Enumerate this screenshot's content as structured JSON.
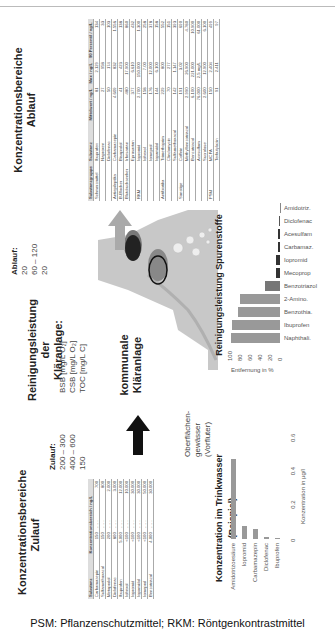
{
  "footer": "PSM: Pflanzenschutzmittel; RKM: Röntgenkontrastmittel",
  "zulauf_section": {
    "title_line1": "Konzentrationsbereiche",
    "title_line2": "Zulauf",
    "headers": [
      "Substanz",
      "Konzentrationsbereich / ng/L"
    ],
    "rows": [
      {
        "substanz": "Carbamazepin",
        "min": "150",
        "max": "700"
      },
      {
        "substanz": "Sulfamethoxazol",
        "min": "150",
        "max": "800"
      },
      {
        "substanz": "Metoprolol",
        "min": "200",
        "max": "2.000"
      },
      {
        "substanz": "Diclofenac",
        "min": "800",
        "max": "3.000"
      },
      {
        "substanz": "Ibuprofen",
        "min": "5.000",
        "max": "12.000"
      },
      {
        "substanz": "Iohexol",
        "min": "<100",
        "max": "10.000"
      },
      {
        "substanz": "Iopromid",
        "min": "<100",
        "max": "30.000"
      },
      {
        "substanz": "Iopamidol",
        "min": "<100",
        "max": "30.000"
      },
      {
        "substanz": "Iomeprol",
        "min": "<100",
        "max": "50.000"
      },
      {
        "substanz": "Benzotriazol",
        "min": "4.000",
        "max": "30.000"
      }
    ]
  },
  "middle": {
    "zulauf_label": "Zulauf:",
    "zulauf_values": [
      "200 – 300",
      "400 – 600",
      "150"
    ],
    "reinigung_title_line1": "Reinigungsleistung der",
    "reinigung_title_line2": "Kläranlage:",
    "params": [
      "BSB [mg/L O₂]",
      "CSB [mg/L O₂]",
      "TOC [mg/L C]"
    ],
    "ablauf_label": "Ablauf:",
    "ablauf_values": [
      "20",
      "60 – 120",
      "20"
    ],
    "plant_label_line1": "kommunale",
    "plant_label_line2": "Kläranlage",
    "water_label_line1": "Oberflächen-",
    "water_label_line2": "gewässer (Vorfluter)"
  },
  "ablauf_section": {
    "title_line1": "Konzentrationsbereiche",
    "title_line2": "Ablauf",
    "headers": [
      "Substanzgruppe",
      "Substanz",
      "Mittelwert / ng/L",
      "Max / ng/L",
      "90 Perzentil / ng/L"
    ],
    "rows": [
      {
        "gruppe": "Schmerzmittel",
        "substanz": "Ibuprofen",
        "mittel": "81",
        "max": "2.129",
        "p90": "134"
      },
      {
        "gruppe": "",
        "substanz": "Naproxen",
        "mittel": "27",
        "max": "958",
        "p90": "33"
      },
      {
        "gruppe": "",
        "substanz": "Diclofenac",
        "mittel": "50",
        "max": "174",
        "p90": "103"
      },
      {
        "gruppe": "Antiepileptika",
        "substanz": "Carbamazepin",
        "mittel": "4.609",
        "max": "832",
        "p90": "1.556"
      },
      {
        "gruppe": "B-Blocker",
        "substanz": "Bisoprolol",
        "mittel": "41",
        "max": "423",
        "p90": "138"
      },
      {
        "gruppe": "Blutdrucksenker",
        "substanz": "Irbesartan",
        "mittel": "480",
        "max": "17.900",
        "p90": "860"
      },
      {
        "gruppe": "",
        "substanz": "Eprosartan",
        "mittel": "377",
        "max": "6.610",
        "p90": "432"
      },
      {
        "gruppe": "RKM",
        "substanz": "Iopromid",
        "mittel": "2.700",
        "max": "150.000",
        "p90": "1.300"
      },
      {
        "gruppe": "",
        "substanz": "Iohexol",
        "mittel": "158",
        "max": "7.00",
        "p90": "258"
      },
      {
        "gruppe": "",
        "substanz": "Iomeprol",
        "mittel": "176",
        "max": "12.000",
        "p90": "378"
      },
      {
        "gruppe": "",
        "substanz": "Iopamidol",
        "mittel": "144",
        "max": "6.100",
        "p90": "158"
      },
      {
        "gruppe": "Antibiotika",
        "substanz": "Trimethoprim",
        "mittel": "229",
        "max": "800",
        "p90": "552"
      },
      {
        "gruppe": "",
        "substanz": "Clindamycin",
        "mittel": "70",
        "max": "277",
        "p90": "151"
      },
      {
        "gruppe": "",
        "substanz": "Sulfamethoxazol",
        "mittel": "142",
        "max": "1.147",
        "p90": "393"
      },
      {
        "gruppe": "Sonstige",
        "substanz": "Coffein",
        "mittel": "191",
        "max": "3.02",
        "p90": "690"
      },
      {
        "gruppe": "",
        "substanz": "Methylbenzotriazol",
        "mittel": "2.990",
        "max": "26.900",
        "p90": "4.780"
      },
      {
        "gruppe": "",
        "substanz": "Benzotriazol",
        "mittel": "6.100",
        "max": "221.000",
        "p90": "10.900"
      },
      {
        "gruppe": "",
        "substanz": "Acesulfam",
        "mittel": "76.000",
        "max": "2,5 mg/L",
        "p90": "61.000"
      },
      {
        "gruppe": "",
        "substanz": "Sucralose",
        "mittel": "2.600",
        "max": "12.900",
        "p90": "6.100"
      },
      {
        "gruppe": "PSM",
        "substanz": "MCPA",
        "mittel": "150",
        "max": "2.404",
        "p90": "499"
      },
      {
        "gruppe": "",
        "substanz": "Terbutylazin",
        "mittel": "91",
        "max": "2.411",
        "p90": "97"
      }
    ]
  },
  "chart_data": [
    {
      "type": "bar",
      "title": "Konzentration im Trinkwasser (Beispiel)",
      "orientation": "horizontal",
      "categories": [
        "Amidotrizoesäure",
        "Iopromid",
        "Carbamazepin",
        "Diclofenac",
        "Ibuprofen"
      ],
      "values": [
        0.48,
        0.08,
        0.06,
        0.01,
        0.005
      ],
      "xlabel": "Konzentration in µg/l",
      "xticks": [
        "0",
        "0.2",
        "0.4",
        "0.6"
      ],
      "xlim": [
        0,
        0.6
      ],
      "color": "#999999"
    },
    {
      "type": "bar",
      "title": "Reinigungsleistung Spurenstoffe",
      "orientation": "vertical",
      "categories": [
        "Naphthali.",
        "Ibuprofen",
        "Benzothia.",
        "2-Amino.",
        "Benzotriazol",
        "Mecoprop",
        "Iopromid",
        "Carbamaz.",
        "Acesulfam",
        "Diclofenac",
        "Amidotriz."
      ],
      "values": [
        98,
        96,
        85,
        80,
        30,
        8,
        8,
        5,
        4,
        2,
        1
      ],
      "ylabel": "Entfernung in %",
      "yticks": [
        "0",
        "20",
        "40",
        "60",
        "80",
        "100"
      ],
      "ylim": [
        0,
        100
      ],
      "colors": [
        "#999999",
        "#999999",
        "#999999",
        "#999999",
        "#777777",
        "#333333",
        "#333333",
        "#333333",
        "#333333",
        "#555555",
        "#888888"
      ]
    }
  ]
}
